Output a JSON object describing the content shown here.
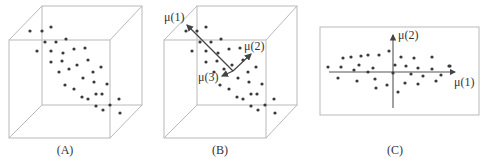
{
  "panels": {
    "A": {
      "caption": "(A)",
      "points": [
        [
          30,
          31
        ],
        [
          42,
          31
        ],
        [
          51,
          27
        ],
        [
          45,
          42
        ],
        [
          56,
          42
        ],
        [
          66,
          39
        ],
        [
          37,
          51
        ],
        [
          51,
          51
        ],
        [
          63,
          53
        ],
        [
          74,
          49
        ],
        [
          85,
          48
        ],
        [
          51,
          62
        ],
        [
          62,
          61
        ],
        [
          59,
          72
        ],
        [
          69,
          69
        ],
        [
          77,
          65
        ],
        [
          88,
          60
        ],
        [
          93,
          72
        ],
        [
          101,
          67
        ],
        [
          65,
          85
        ],
        [
          74,
          89
        ],
        [
          83,
          78
        ],
        [
          94,
          82
        ],
        [
          107,
          84
        ],
        [
          82,
          97
        ],
        [
          88,
          99
        ],
        [
          96,
          94
        ],
        [
          102,
          94
        ],
        [
          110,
          105
        ],
        [
          119,
          99
        ],
        [
          96,
          106
        ],
        [
          103,
          110
        ],
        [
          120,
          113
        ]
      ]
    },
    "B": {
      "caption": "(B)",
      "points": [
        [
          186,
          31
        ],
        [
          197,
          31
        ],
        [
          206,
          27
        ],
        [
          200,
          42
        ],
        [
          211,
          42
        ],
        [
          221,
          39
        ],
        [
          192,
          51
        ],
        [
          206,
          51
        ],
        [
          218,
          53
        ],
        [
          229,
          49
        ],
        [
          240,
          48
        ],
        [
          206,
          62
        ],
        [
          217,
          61
        ],
        [
          214,
          72
        ],
        [
          224,
          69
        ],
        [
          232,
          65
        ],
        [
          243,
          60
        ],
        [
          248,
          72
        ],
        [
          256,
          67
        ],
        [
          220,
          85
        ],
        [
          229,
          89
        ],
        [
          238,
          78
        ],
        [
          249,
          82
        ],
        [
          262,
          84
        ],
        [
          237,
          97
        ],
        [
          243,
          99
        ],
        [
          251,
          94
        ],
        [
          257,
          94
        ],
        [
          265,
          105
        ],
        [
          274,
          99
        ],
        [
          251,
          106
        ],
        [
          258,
          110
        ],
        [
          275,
          113
        ]
      ],
      "vectors": [
        {
          "label": "μ(1)",
          "from": [
            233,
            71
          ],
          "to": [
            187,
            25
          ],
          "label_pos": [
            164,
            21
          ]
        },
        {
          "label": "μ(2)",
          "from": [
            233,
            71
          ],
          "to": [
            251,
            54
          ],
          "label_pos": [
            244,
            50
          ]
        },
        {
          "label": "μ(3)",
          "from": [
            233,
            71
          ],
          "to": [
            222,
            76
          ],
          "label_pos": [
            198,
            81
          ]
        }
      ]
    },
    "C": {
      "caption": "(C)",
      "x_axis_label": "μ(1)",
      "y_axis_label": "μ(2)",
      "points": [
        [
          328,
          67
        ],
        [
          338,
          78
        ],
        [
          343,
          58
        ],
        [
          341,
          67
        ],
        [
          351,
          57
        ],
        [
          354,
          70
        ],
        [
          357,
          81
        ],
        [
          361,
          56
        ],
        [
          359,
          65
        ],
        [
          368,
          55
        ],
        [
          368,
          72
        ],
        [
          373,
          68
        ],
        [
          375,
          79
        ],
        [
          376,
          88
        ],
        [
          379,
          55
        ],
        [
          389,
          51
        ],
        [
          387,
          85
        ],
        [
          393,
          73
        ],
        [
          395,
          65
        ],
        [
          401,
          57
        ],
        [
          398,
          92
        ],
        [
          406,
          66
        ],
        [
          405,
          83
        ],
        [
          411,
          74
        ],
        [
          414,
          58
        ],
        [
          418,
          68
        ],
        [
          418,
          84
        ],
        [
          423,
          76
        ],
        [
          432,
          57
        ],
        [
          432,
          69
        ],
        [
          436,
          81
        ],
        [
          441,
          75
        ],
        [
          450,
          66
        ],
        [
          449,
          66
        ]
      ]
    }
  }
}
